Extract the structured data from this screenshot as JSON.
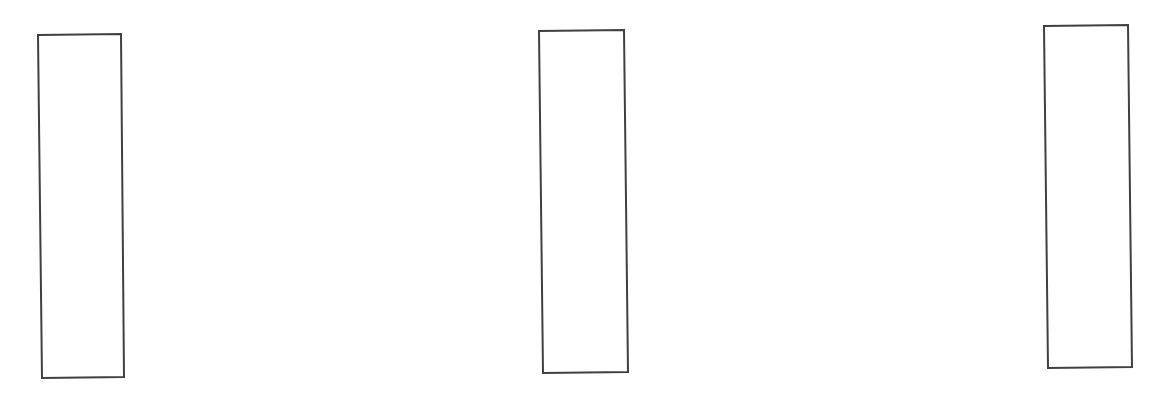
{
  "canvas": {
    "width": 1168,
    "height": 400,
    "background": "#ffffff"
  },
  "style": {
    "stroke_color": "#404040",
    "stroke_width": 2,
    "fill_color": "#ffffff"
  },
  "rectangles": [
    {
      "id": "left",
      "points": [
        [
          38,
          35
        ],
        [
          121,
          34
        ],
        [
          124,
          377
        ],
        [
          42,
          378
        ]
      ]
    },
    {
      "id": "middle",
      "points": [
        [
          539,
          31
        ],
        [
          624,
          30
        ],
        [
          628,
          372
        ],
        [
          543,
          373
        ]
      ]
    },
    {
      "id": "right",
      "points": [
        [
          1044,
          26
        ],
        [
          1128,
          25
        ],
        [
          1132,
          367
        ],
        [
          1048,
          368
        ]
      ]
    }
  ]
}
